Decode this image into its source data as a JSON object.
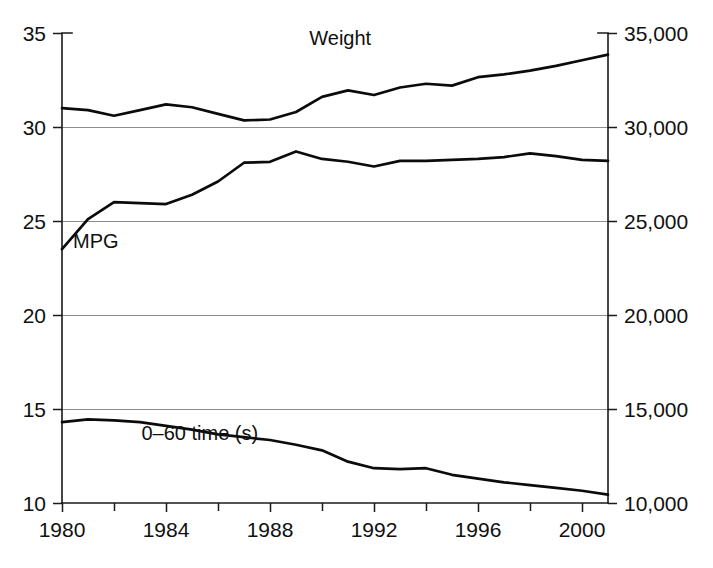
{
  "chart_data": {
    "type": "line",
    "title": "",
    "xlabel": "",
    "ylabel": "",
    "ylabel_right": "",
    "grid": true,
    "legend_position": "inline-annotations",
    "xlim": [
      1980,
      2001
    ],
    "ylim": [
      10,
      35
    ],
    "ylim_right": [
      10000,
      35000
    ],
    "x_ticks_major": [
      1980,
      1984,
      1988,
      1992,
      1996,
      2000
    ],
    "x_ticks_minor": [
      1982,
      1986,
      1990,
      1994,
      1998
    ],
    "x_tick_labels": [
      "1980",
      "1984",
      "1988",
      "1992",
      "1996",
      "2000"
    ],
    "y_ticks_left": [
      10,
      15,
      20,
      25,
      30,
      35
    ],
    "y_tick_labels_left": [
      "10",
      "15",
      "20",
      "25",
      "30",
      "35"
    ],
    "y_ticks_right": [
      10000,
      15000,
      20000,
      25000,
      30000,
      35000
    ],
    "y_tick_labels_right": [
      "10,000",
      "15,000",
      "20,000",
      "25,000",
      "30,000",
      "35,000"
    ],
    "gridline_values": [
      15,
      20,
      25,
      30
    ],
    "x": [
      1980,
      1981,
      1982,
      1983,
      1984,
      1985,
      1986,
      1987,
      1988,
      1989,
      1990,
      1991,
      1992,
      1993,
      1994,
      1995,
      1996,
      1997,
      1998,
      1999,
      2000,
      2001
    ],
    "series": [
      {
        "name": "Weight",
        "axis": "right",
        "label": "Weight",
        "label_x": 1990.7,
        "label_y": 34.35,
        "color": "#0b0b0b",
        "values": [
          31000,
          30900,
          30600,
          30900,
          31200,
          31050,
          30700,
          30350,
          30400,
          30800,
          31600,
          31950,
          31700,
          32100,
          32300,
          32200,
          32650,
          32800,
          33000,
          33250,
          33550,
          33850
        ],
        "values_left_scale": [
          31.0,
          30.9,
          30.6,
          30.9,
          31.2,
          31.05,
          30.7,
          30.35,
          30.4,
          30.8,
          31.6,
          31.95,
          31.7,
          32.1,
          32.3,
          32.2,
          32.65,
          32.8,
          33.0,
          33.25,
          33.55,
          33.85
        ]
      },
      {
        "name": "MPG",
        "axis": "left",
        "label": "MPG",
        "label_x": 1981.3,
        "label_y": 23.55,
        "color": "#0b0b0b",
        "values": [
          23.5,
          25.1,
          26.0,
          25.95,
          25.9,
          26.4,
          27.1,
          28.1,
          28.15,
          28.7,
          28.3,
          28.15,
          27.9,
          28.2,
          28.2,
          28.25,
          28.3,
          28.4,
          28.6,
          28.45,
          28.25,
          28.2
        ]
      },
      {
        "name": "0-60 time (s)",
        "axis": "left",
        "label": "0–60 time (s)",
        "label_x": 1985.3,
        "label_y": 13.35,
        "color": "#0b0b0b",
        "values": [
          14.3,
          14.45,
          14.4,
          14.3,
          14.1,
          13.9,
          13.65,
          13.5,
          13.35,
          13.1,
          12.8,
          12.2,
          11.85,
          11.8,
          11.85,
          11.5,
          11.3,
          11.1,
          10.95,
          10.8,
          10.65,
          10.45
        ]
      }
    ]
  },
  "axes_labels": {
    "left_axis_name": "fuel-economy-and-time-axis",
    "right_axis_name": "vehicle-weight-axis"
  }
}
